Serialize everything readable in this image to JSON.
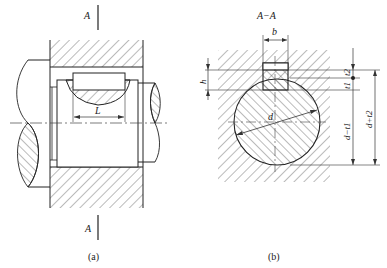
{
  "figure_a": {
    "section_label_top": "A",
    "section_label_bottom": "A",
    "dimension_length": "L",
    "caption": "(a)"
  },
  "figure_b": {
    "section_title": "A−A",
    "dim_key_width": "b",
    "dim_key_height": "h",
    "dim_shaft_diameter": "d",
    "dim_hub_depth": "t2",
    "dim_shaft_depth": "t1",
    "dim_d_minus_t1": "d−t1",
    "dim_d_plus_t2": "d+t2",
    "caption": "(b)"
  },
  "colors": {
    "line": "#2a2a2a",
    "hatch": "#555555",
    "background": "#ffffff"
  }
}
